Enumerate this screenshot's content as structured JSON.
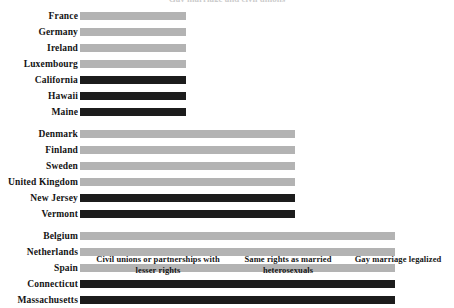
{
  "chart_data": {
    "type": "bar",
    "orientation": "horizontal",
    "title": "",
    "xlabel": "",
    "ylabel": "",
    "grid": false,
    "legend": false,
    "x_axis_groups": [
      "Civil unions or partnerships with lesser rights",
      "Same rights as married heterosexuals",
      "Gay marriage legalized"
    ],
    "x_category_levels": [
      1,
      2,
      3
    ],
    "categories": [
      "France",
      "Germany",
      "Ireland",
      "Luxembourg",
      "California",
      "Hawaii",
      "Maine",
      "Denmark",
      "Finland",
      "Sweden",
      "United Kingdom",
      "New Jersey",
      "Vermont",
      "Belgium",
      "Netherlands",
      "Spain",
      "Connecticut",
      "Massachusetts"
    ],
    "values": [
      1,
      1,
      1,
      1,
      1,
      1,
      1,
      2,
      2,
      2,
      2,
      2,
      2,
      3,
      3,
      3,
      3,
      3
    ],
    "series": [
      {
        "name": "Level of recognition",
        "values": [
          1,
          1,
          1,
          1,
          1,
          1,
          1,
          2,
          2,
          2,
          2,
          2,
          2,
          3,
          3,
          3,
          3,
          3
        ]
      }
    ],
    "bar_colors": [
      "light",
      "light",
      "light",
      "light",
      "dark",
      "dark",
      "dark",
      "light",
      "light",
      "light",
      "light",
      "dark",
      "dark",
      "light",
      "light",
      "light",
      "dark",
      "dark"
    ],
    "color_key": {
      "light": "#b3b3b3",
      "dark": "#1c1c1c"
    }
  },
  "colors": {
    "light_bar": "#b3b3b3",
    "dark_bar": "#1c1c1c",
    "text": "#141414",
    "background": "#ffffff"
  },
  "clipped_title": "Gay marriage and civil unions",
  "rows": [
    {
      "label": "France",
      "level": 1,
      "shade": "light"
    },
    {
      "label": "Germany",
      "level": 1,
      "shade": "light"
    },
    {
      "label": "Ireland",
      "level": 1,
      "shade": "light"
    },
    {
      "label": "Luxembourg",
      "level": 1,
      "shade": "light"
    },
    {
      "label": "California",
      "level": 1,
      "shade": "dark"
    },
    {
      "label": "Hawaii",
      "level": 1,
      "shade": "dark"
    },
    {
      "label": "Maine",
      "level": 1,
      "shade": "dark"
    },
    {
      "label": "Denmark",
      "level": 2,
      "shade": "light"
    },
    {
      "label": "Finland",
      "level": 2,
      "shade": "light"
    },
    {
      "label": "Sweden",
      "level": 2,
      "shade": "light"
    },
    {
      "label": "United Kingdom",
      "level": 2,
      "shade": "light"
    },
    {
      "label": "New Jersey",
      "level": 2,
      "shade": "dark"
    },
    {
      "label": "Vermont",
      "level": 2,
      "shade": "dark"
    },
    {
      "label": "Belgium",
      "level": 3,
      "shade": "light"
    },
    {
      "label": "Netherlands",
      "level": 3,
      "shade": "light"
    },
    {
      "label": "Spain",
      "level": 3,
      "shade": "light"
    },
    {
      "label": "Connecticut",
      "level": 3,
      "shade": "dark"
    },
    {
      "label": "Massachusetts",
      "level": 3,
      "shade": "dark"
    }
  ],
  "x_axis": {
    "groups": [
      {
        "line1": "Civil unions or partnerships with",
        "line2": "lesser rights"
      },
      {
        "line1": "Same rights as married",
        "line2": "heterosexuals"
      },
      {
        "line1": "Gay marriage legalized",
        "line2": ""
      }
    ]
  }
}
